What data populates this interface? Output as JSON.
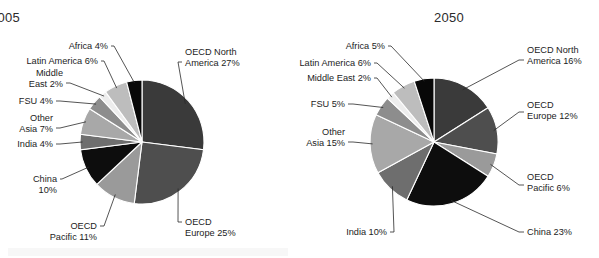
{
  "figure": {
    "background": "#ffffff",
    "panels": [
      "2005",
      "2050"
    ]
  },
  "chart_data": [
    {
      "type": "pie",
      "title": "2005",
      "xlabel": "",
      "ylabel": "",
      "legend_position": "callout-labels",
      "grid": false,
      "start_angle_deg": -90,
      "direction": "clockwise",
      "categories": [
        "OECD North America",
        "OECD Europe",
        "OECD Pacific",
        "China",
        "India",
        "Other Asia",
        "FSU",
        "Middle East",
        "Latin America",
        "Africa"
      ],
      "values": [
        27,
        25,
        11,
        10,
        4,
        7,
        4,
        2,
        6,
        4
      ],
      "unit": "%",
      "labels": [
        "OECD North America 27%",
        "OECD Europe 25%",
        "OECD Pacific 11%",
        "China 10%",
        "India 4%",
        "Other Asia 7%",
        "FSU 4%",
        "Middle East 2%",
        "Latin America 6%",
        "Africa 4%"
      ],
      "colors": [
        "#3a3a3a",
        "#4e4e4e",
        "#9a9a9a",
        "#0d0d0d",
        "#6e6e6e",
        "#a8a8a8",
        "#8d8d8d",
        "#ededed",
        "#bdbdbd",
        "#080808"
      ],
      "callouts": [
        {
          "text_line1": "OECD North",
          "text_line2": "America 27%",
          "side": "right"
        },
        {
          "text_line1": "OECD",
          "text_line2": "Europe 25%",
          "side": "right"
        },
        {
          "text_line1": "OECD",
          "text_line2": "Pacific 11%",
          "side": "left"
        },
        {
          "text_line1": "China",
          "text_line2": "10%",
          "side": "left"
        },
        {
          "text_line1": "India 4%",
          "text_line2": "",
          "side": "left"
        },
        {
          "text_line1": "Other",
          "text_line2": "Asia 7%",
          "side": "left"
        },
        {
          "text_line1": "FSU 4%",
          "text_line2": "",
          "side": "left"
        },
        {
          "text_line1": "Middle",
          "text_line2": "East 2%",
          "side": "left"
        },
        {
          "text_line1": "Latin America 6%",
          "text_line2": "",
          "side": "left"
        },
        {
          "text_line1": "Africa 4%",
          "text_line2": "",
          "side": "left"
        }
      ]
    },
    {
      "type": "pie",
      "title": "2050",
      "xlabel": "",
      "ylabel": "",
      "legend_position": "callout-labels",
      "grid": false,
      "start_angle_deg": -90,
      "direction": "clockwise",
      "categories": [
        "OECD North America",
        "OECD Europe",
        "OECD Pacific",
        "China",
        "India",
        "Other Asia",
        "FSU",
        "Middle East",
        "Latin America",
        "Africa"
      ],
      "values": [
        16,
        12,
        6,
        23,
        10,
        15,
        5,
        2,
        6,
        5
      ],
      "unit": "%",
      "labels": [
        "OECD North America 16%",
        "OECD Europe 12%",
        "OECD Pacific 6%",
        "China 23%",
        "India 10%",
        "Other Asia 15%",
        "FSU 5%",
        "Middle East 2%",
        "Latin America 6%",
        "Africa 5%"
      ],
      "colors": [
        "#3a3a3a",
        "#4e4e4e",
        "#9a9a9a",
        "#0d0d0d",
        "#6e6e6e",
        "#a8a8a8",
        "#8d8d8d",
        "#ededed",
        "#bdbdbd",
        "#080808"
      ],
      "callouts": [
        {
          "text_line1": "OECD North",
          "text_line2": "America 16%",
          "side": "right"
        },
        {
          "text_line1": "OECD",
          "text_line2": "Europe 12%",
          "side": "right"
        },
        {
          "text_line1": "OECD",
          "text_line2": "Pacific 6%",
          "side": "right"
        },
        {
          "text_line1": "China 23%",
          "text_line2": "",
          "side": "right"
        },
        {
          "text_line1": "India 10%",
          "text_line2": "",
          "side": "left"
        },
        {
          "text_line1": "Other",
          "text_line2": "Asia 15%",
          "side": "left"
        },
        {
          "text_line1": "FSU 5%",
          "text_line2": "",
          "side": "left"
        },
        {
          "text_line1": "Middle East 2%",
          "text_line2": "",
          "side": "left"
        },
        {
          "text_line1": "Latin America 6%",
          "text_line2": "",
          "side": "left"
        },
        {
          "text_line1": "Africa 5%",
          "text_line2": "",
          "side": "left"
        }
      ]
    }
  ]
}
